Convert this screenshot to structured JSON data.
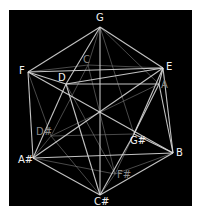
{
  "diagram": {
    "title": "",
    "background": "#000000",
    "edge_color_front": "#d8d8d8",
    "edge_color_back": "#7a7a7a",
    "vertices": [
      {
        "id": "G",
        "label": "G",
        "x": 100,
        "y": 27,
        "lx": 96,
        "ly": 13,
        "depth": "front"
      },
      {
        "id": "F",
        "label": "F",
        "x": 28,
        "y": 72,
        "lx": 19,
        "ly": 66,
        "depth": "front"
      },
      {
        "id": "E",
        "label": "E",
        "x": 163,
        "y": 68,
        "lx": 166,
        "ly": 62,
        "depth": "front"
      },
      {
        "id": "D",
        "label": "D",
        "x": 66,
        "y": 84,
        "lx": 58,
        "ly": 73,
        "depth": "front"
      },
      {
        "id": "C",
        "label": "C",
        "x": 88,
        "y": 65,
        "lx": 83,
        "ly": 55,
        "depth": "back"
      },
      {
        "id": "A",
        "label": "A",
        "x": 159,
        "y": 84,
        "lx": 161,
        "ly": 80,
        "depth": "back"
      },
      {
        "id": "Ds",
        "label": "D#",
        "x": 51,
        "y": 136,
        "lx": 36,
        "ly": 127,
        "depth": "back"
      },
      {
        "id": "Gs",
        "label": "G#",
        "x": 134,
        "y": 134,
        "lx": 130,
        "ly": 136,
        "depth": "front"
      },
      {
        "id": "As",
        "label": "A#",
        "x": 33,
        "y": 158,
        "lx": 18,
        "ly": 155,
        "depth": "front"
      },
      {
        "id": "B",
        "label": "B",
        "x": 173,
        "y": 153,
        "lx": 176,
        "ly": 148,
        "depth": "front"
      },
      {
        "id": "Fs",
        "label": "F#",
        "x": 115,
        "y": 174,
        "lx": 117,
        "ly": 170,
        "depth": "back"
      },
      {
        "id": "Cs",
        "label": "C#",
        "x": 100,
        "y": 195,
        "lx": 94,
        "ly": 197,
        "depth": "front"
      }
    ],
    "edges": [
      [
        "G",
        "F",
        "front"
      ],
      [
        "G",
        "E",
        "front"
      ],
      [
        "G",
        "D",
        "front"
      ],
      [
        "G",
        "Cs",
        "front"
      ],
      [
        "G",
        "C",
        "back"
      ],
      [
        "G",
        "A",
        "back"
      ],
      [
        "G",
        "Gs",
        "back"
      ],
      [
        "F",
        "E",
        "front"
      ],
      [
        "F",
        "D",
        "front"
      ],
      [
        "F",
        "B",
        "front"
      ],
      [
        "F",
        "As",
        "front"
      ],
      [
        "F",
        "Ds",
        "back"
      ],
      [
        "F",
        "C",
        "back"
      ],
      [
        "E",
        "As",
        "front"
      ],
      [
        "E",
        "A",
        "front"
      ],
      [
        "E",
        "B",
        "front"
      ],
      [
        "E",
        "D",
        "front"
      ],
      [
        "E",
        "Gs",
        "front"
      ],
      [
        "E",
        "C",
        "back"
      ],
      [
        "D",
        "A",
        "front"
      ],
      [
        "D",
        "Cs",
        "front"
      ],
      [
        "D",
        "As",
        "front"
      ],
      [
        "D",
        "Fs",
        "back"
      ],
      [
        "A",
        "B",
        "front"
      ],
      [
        "A",
        "Gs",
        "front"
      ],
      [
        "A",
        "Ds",
        "back"
      ],
      [
        "C",
        "Ds",
        "back"
      ],
      [
        "C",
        "Fs",
        "back"
      ],
      [
        "Ds",
        "Gs",
        "back"
      ],
      [
        "Ds",
        "As",
        "back"
      ],
      [
        "Ds",
        "Cs",
        "back"
      ],
      [
        "Gs",
        "Cs",
        "front"
      ],
      [
        "Gs",
        "B",
        "front"
      ],
      [
        "Gs",
        "Fs",
        "back"
      ],
      [
        "As",
        "Cs",
        "front"
      ],
      [
        "As",
        "B",
        "front"
      ],
      [
        "B",
        "Cs",
        "front"
      ],
      [
        "B",
        "Fs",
        "back"
      ],
      [
        "Fs",
        "Cs",
        "back"
      ],
      [
        "Fs",
        "As",
        "back"
      ]
    ]
  }
}
